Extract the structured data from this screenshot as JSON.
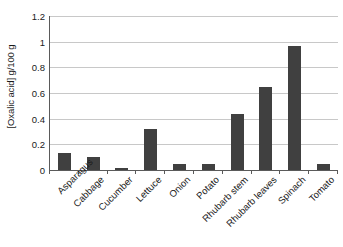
{
  "chart_data": {
    "type": "bar",
    "title": "",
    "xlabel": "",
    "ylabel": "[Oxalic acid] g/100 g",
    "ylim": [
      0,
      1.2
    ],
    "ytick_labels": [
      "0",
      "0.2",
      "0.4",
      "0.6",
      "0.8",
      "1",
      "1.2"
    ],
    "ytick_values": [
      0,
      0.2,
      0.4,
      0.6,
      0.8,
      1,
      1.2
    ],
    "grid": "horizontal",
    "legend": "none",
    "bar_color": "#404040",
    "gridline_color": "#c8c8c8",
    "axis_color": "#5a5a5a",
    "background_color": "#ffffff",
    "categories": [
      "Asparagus",
      "Cabbage",
      "Cucumber",
      "Lettuce",
      "Onion",
      "Potato",
      "Rhubarb stem",
      "Rhubarb leaves",
      "Spinach",
      "Tomato"
    ],
    "values": [
      0.13,
      0.1,
      0.015,
      0.32,
      0.045,
      0.045,
      0.44,
      0.645,
      0.965,
      0.045
    ]
  }
}
